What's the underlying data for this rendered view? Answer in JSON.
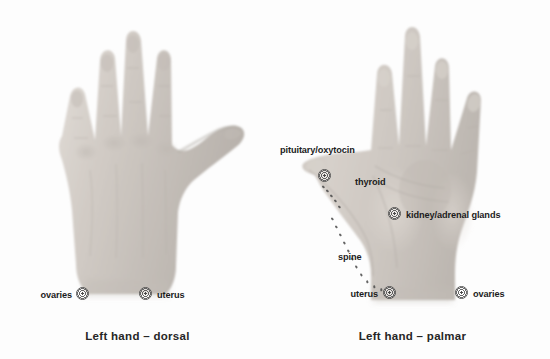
{
  "figure": {
    "title_dorsal": "Left hand – dorsal",
    "title_palmar": "Left hand – palmar",
    "background_color": "#fdfdfd",
    "label_color": "#1c1c1c",
    "marker_color": "#4a4a4a",
    "skin_color": "#cfc9c3"
  },
  "dorsal": {
    "caption": "Left hand – dorsal",
    "annotations": [
      {
        "label": "ovaries",
        "side": "right"
      },
      {
        "label": "uterus",
        "side": "left"
      }
    ]
  },
  "palmar": {
    "caption": "Left hand – palmar",
    "annotations": [
      {
        "label": "pituitary/oxytocin",
        "side": "above"
      },
      {
        "label": "thyroid",
        "side": "right"
      },
      {
        "label": "kidney/adrenal glands",
        "side": "right"
      },
      {
        "label": "spine",
        "side": "left"
      },
      {
        "label": "uterus",
        "side": "left"
      },
      {
        "label": "ovaries",
        "side": "right"
      }
    ]
  }
}
